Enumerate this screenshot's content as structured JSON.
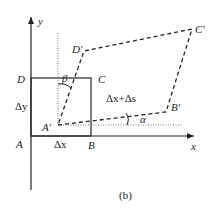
{
  "figure": {
    "caption": "(b)",
    "axes": {
      "x_label": "x",
      "y_label": "y"
    },
    "original_square": {
      "vertices": {
        "A": "A",
        "B": "B",
        "C": "C",
        "D": "D"
      },
      "side_x_label": "Δx",
      "side_y_label": "Δy"
    },
    "deformed_shape": {
      "vertices": {
        "A_prime": "A'",
        "B_prime": "B'",
        "C_prime": "C'",
        "D_prime": "D'"
      },
      "stretched_side_label": "Δx+Δs"
    },
    "angles": {
      "alpha": "α",
      "beta": "β"
    },
    "colors": {
      "stroke": "#222222",
      "dotted": "#777777",
      "background": "#ffffff"
    }
  }
}
